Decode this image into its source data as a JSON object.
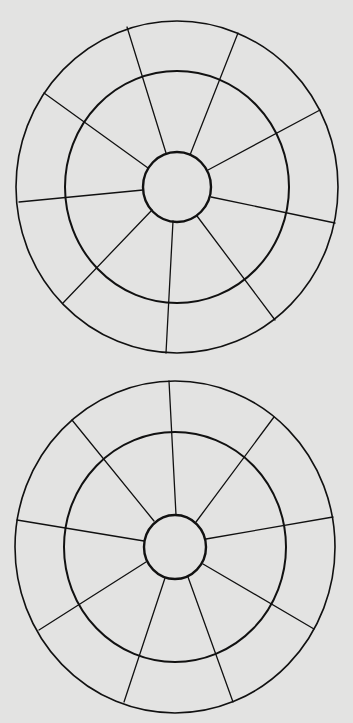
{
  "diagram": {
    "title": "",
    "background_color": "#e3e3e2",
    "line_color": "#111111",
    "wheels": [
      {
        "name": "wheel-top",
        "center": [
          177,
          187
        ],
        "hub": {
          "rx": 34,
          "ry": 35
        },
        "middle_ring": {
          "rx": 112,
          "ry": 116
        },
        "outer_ring": {
          "rx": 161,
          "ry": 166
        },
        "spoke_count": 9,
        "spokes": [
          {
            "x1": 166,
            "y1": 153,
            "x2": 127,
            "y2": 27
          },
          {
            "x1": 190,
            "y1": 155,
            "x2": 238,
            "y2": 33
          },
          {
            "x1": 208,
            "y1": 170,
            "x2": 320,
            "y2": 110
          },
          {
            "x1": 211,
            "y1": 197,
            "x2": 335,
            "y2": 223
          },
          {
            "x1": 197,
            "y1": 216,
            "x2": 275,
            "y2": 320
          },
          {
            "x1": 173,
            "y1": 221,
            "x2": 166,
            "y2": 353
          },
          {
            "x1": 152,
            "y1": 210,
            "x2": 63,
            "y2": 303
          },
          {
            "x1": 143,
            "y1": 190,
            "x2": 19,
            "y2": 202
          },
          {
            "x1": 148,
            "y1": 168,
            "x2": 44,
            "y2": 93
          }
        ]
      },
      {
        "name": "wheel-bottom",
        "center": [
          175,
          547
        ],
        "hub": {
          "rx": 31,
          "ry": 32
        },
        "middle_ring": {
          "rx": 111,
          "ry": 115
        },
        "outer_ring": {
          "rx": 160,
          "ry": 166
        },
        "spoke_count": 9,
        "spokes": [
          {
            "x1": 176,
            "y1": 515,
            "x2": 169,
            "y2": 381
          },
          {
            "x1": 196,
            "y1": 522,
            "x2": 274,
            "y2": 417
          },
          {
            "x1": 206,
            "y1": 539,
            "x2": 333,
            "y2": 517
          },
          {
            "x1": 203,
            "y1": 564,
            "x2": 314,
            "y2": 629
          },
          {
            "x1": 188,
            "y1": 577,
            "x2": 233,
            "y2": 702
          },
          {
            "x1": 165,
            "y1": 578,
            "x2": 124,
            "y2": 702
          },
          {
            "x1": 146,
            "y1": 562,
            "x2": 39,
            "y2": 630
          },
          {
            "x1": 144,
            "y1": 541,
            "x2": 17,
            "y2": 520
          },
          {
            "x1": 154,
            "y1": 521,
            "x2": 72,
            "y2": 420
          }
        ]
      }
    ]
  }
}
